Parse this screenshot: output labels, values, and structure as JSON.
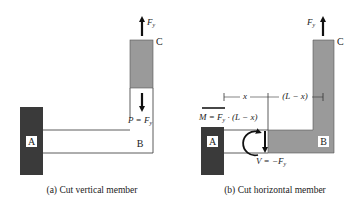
{
  "panels": [
    {
      "id": "a",
      "caption": "(a) Cut vertical member",
      "labels": {
        "wall": "A",
        "corner": "B",
        "tip": "C",
        "force": "F",
        "force_sub": "y",
        "internal": "P = F",
        "internal_sub": "y"
      }
    },
    {
      "id": "b",
      "caption": "(b) Cut horizontal member",
      "labels": {
        "wall": "A",
        "corner": "B",
        "tip": "C",
        "force": "F",
        "force_sub": "y",
        "moment": "M = F",
        "moment_sub": "y",
        "moment_tail": " · (L − x)",
        "shear": "V = −F",
        "shear_sub": "y",
        "dim_x": "x",
        "dim_lx": "(L − x)"
      }
    }
  ],
  "colors": {
    "wall": "#3a3a3a",
    "member": "#9a9a9a",
    "line": "#333333",
    "arrow": "#111111"
  }
}
